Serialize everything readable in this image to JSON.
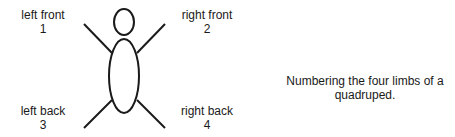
{
  "diagram": {
    "limbs": [
      {
        "id": "left-front",
        "label": "left front",
        "number": "1"
      },
      {
        "id": "right-front",
        "label": "right front",
        "number": "2"
      },
      {
        "id": "left-back",
        "label": "left back",
        "number": "3"
      },
      {
        "id": "right-back",
        "label": "right back",
        "number": "4"
      }
    ],
    "caption": "Numbering the four limbs of a quadruped.",
    "stroke_color": "#1a1a1a"
  }
}
